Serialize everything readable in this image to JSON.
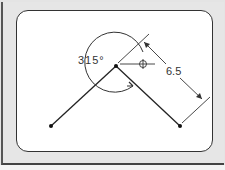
{
  "diagram": {
    "angle_label": "315°",
    "length_label": "6.5",
    "colors": {
      "line": "#222222",
      "panel": "#ffffff",
      "frame": "#e6e6e6"
    }
  }
}
